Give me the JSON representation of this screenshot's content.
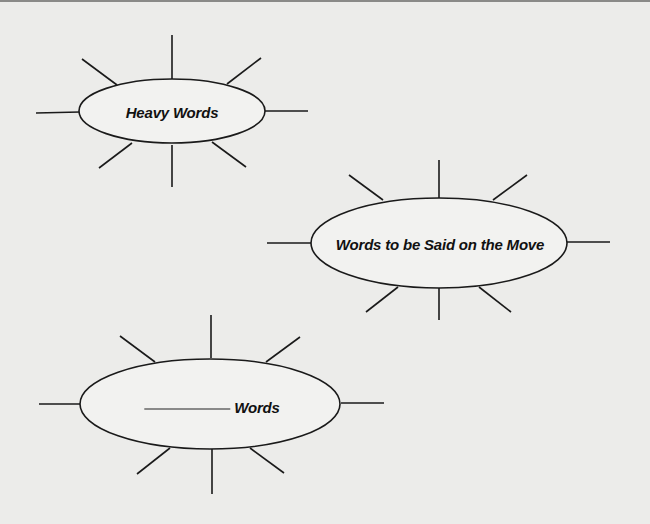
{
  "diagrams": [
    {
      "id": "heavy-words",
      "label": "Heavy Words",
      "cx": 172,
      "cy": 111,
      "rx": 93,
      "ry": 32
    },
    {
      "id": "words-on-the-move",
      "label": "Words to be Said on the Move",
      "cx": 439,
      "cy": 243,
      "rx": 128,
      "ry": 45
    },
    {
      "id": "blank-words",
      "blank": "__________",
      "label": "Words",
      "cx": 210,
      "cy": 404,
      "rx": 130,
      "ry": 45
    }
  ],
  "colors": {
    "background": "#ececea",
    "stroke": "#1a1a1a",
    "ellipse_fill": "#f2f2f0"
  }
}
